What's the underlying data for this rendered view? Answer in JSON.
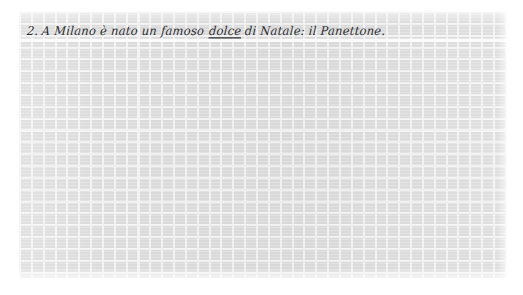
{
  "worksheet": {
    "paper_style": "squared-grid",
    "grid_cell_color": "#dddedd",
    "grid_line_color": "#f4f4f4",
    "ink_color": "#2d2d30",
    "lines": [
      {
        "number_label": "2.",
        "text_before": " A Milano è nato un famoso ",
        "emphasis": "dolce",
        "emphasis_style": "underline",
        "text_after": " di Natale: il Panettone.",
        "full_text": "2. A Milano è nato un famoso dolce di Natale: il Panettone."
      }
    ]
  }
}
